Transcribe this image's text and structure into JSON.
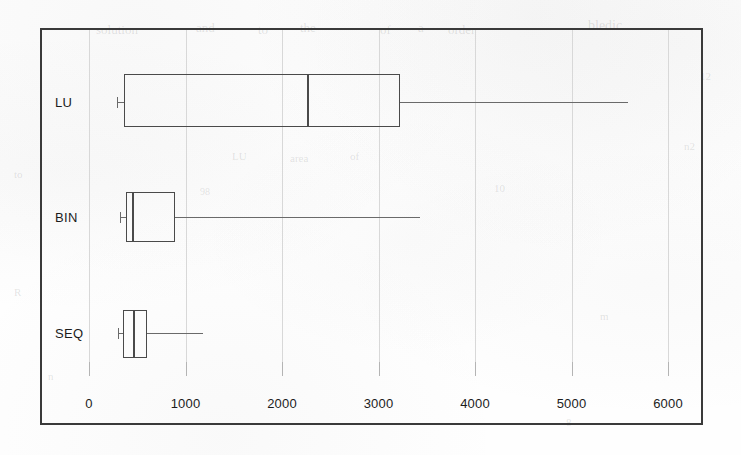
{
  "figure": {
    "background_color": "#fefefe",
    "frame_color": "#3a3a3a",
    "grid_color": "#d8d8d8",
    "box_color": "#4a4a4a",
    "whisker_color": "#6a6a6a"
  },
  "chart_data": {
    "type": "box",
    "title": "",
    "xlabel": "",
    "ylabel": "",
    "orientation": "horizontal",
    "grid": true,
    "legend": "none",
    "xlim": [
      -130,
      6360
    ],
    "xticks": [
      0,
      1000,
      2000,
      3000,
      4000,
      5000,
      6000
    ],
    "xtick_labels": [
      "0",
      "1000",
      "2000",
      "3000",
      "4000",
      "5000",
      "6000"
    ],
    "categories": [
      "LU",
      "BIN",
      "SEQ"
    ],
    "boxes": [
      {
        "label": "LU",
        "whisker_low": 290,
        "q1": 363,
        "median": 2259,
        "q3": 3223,
        "whisker_high": 5585
      },
      {
        "label": "BIN",
        "whisker_low": 321,
        "q1": 383,
        "median": 446,
        "q3": 891,
        "whisker_high": 3430
      },
      {
        "label": "SEQ",
        "whisker_low": 301,
        "q1": 352,
        "median": 456,
        "q3": 601,
        "whisker_high": 1181
      }
    ]
  },
  "ghost_marks": [
    {
      "text": "solution",
      "x": 96,
      "y": 22,
      "size": 13,
      "rot": 0
    },
    {
      "text": "and",
      "x": 196,
      "y": 20,
      "size": 13,
      "rot": 0
    },
    {
      "text": "to",
      "x": 258,
      "y": 22,
      "size": 13,
      "rot": 0
    },
    {
      "text": "the",
      "x": 300,
      "y": 20,
      "size": 13,
      "rot": 0
    },
    {
      "text": "of",
      "x": 380,
      "y": 22,
      "size": 13,
      "rot": 0
    },
    {
      "text": "a",
      "x": 418,
      "y": 20,
      "size": 13,
      "rot": 0
    },
    {
      "text": "order",
      "x": 448,
      "y": 22,
      "size": 13,
      "rot": 0
    },
    {
      "text": "bledic",
      "x": 588,
      "y": 18,
      "size": 14,
      "rot": 0
    },
    {
      "text": "12",
      "x": 700,
      "y": 70,
      "size": 11,
      "rot": 0
    },
    {
      "text": "n2",
      "x": 684,
      "y": 140,
      "size": 11,
      "rot": 0
    },
    {
      "text": "LU",
      "x": 232,
      "y": 150,
      "size": 11,
      "rot": 0
    },
    {
      "text": "area",
      "x": 290,
      "y": 152,
      "size": 11,
      "rot": 0
    },
    {
      "text": "of",
      "x": 350,
      "y": 150,
      "size": 11,
      "rot": 0
    },
    {
      "text": "10",
      "x": 494,
      "y": 182,
      "size": 11,
      "rot": 0
    },
    {
      "text": "98",
      "x": 200,
      "y": 186,
      "size": 10,
      "rot": 0
    },
    {
      "text": "to",
      "x": 14,
      "y": 168,
      "size": 11,
      "rot": 0
    },
    {
      "text": "R",
      "x": 14,
      "y": 286,
      "size": 11,
      "rot": 0
    },
    {
      "text": "n",
      "x": 48,
      "y": 370,
      "size": 11,
      "rot": 0
    },
    {
      "text": "m",
      "x": 600,
      "y": 310,
      "size": 11,
      "rot": 0
    },
    {
      "text": "8",
      "x": 566,
      "y": 416,
      "size": 11,
      "rot": 0
    }
  ],
  "geometry": {
    "frame": {
      "left": 40,
      "top": 28,
      "right": 703,
      "bottom": 425
    },
    "x_zero_px": 89,
    "px_per_1000": 96.5,
    "rows": [
      {
        "label": "LU",
        "center_y": 102,
        "box_top": 74,
        "box_bottom": 127
      },
      {
        "label": "BIN",
        "center_y": 217,
        "box_top": 192,
        "box_bottom": 242
      },
      {
        "label": "SEQ",
        "center_y": 333,
        "box_top": 310,
        "box_bottom": 358
      }
    ],
    "label_x": 55,
    "tick_label_y": 396,
    "tick_mark_top": 362,
    "tick_mark_height": 14
  }
}
